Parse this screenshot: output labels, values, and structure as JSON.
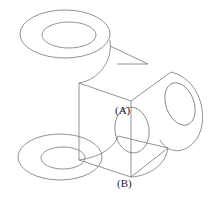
{
  "figure": {
    "line_color": "#777777",
    "background": "#ffffff",
    "labels": {
      "a": "(A)",
      "b": "(B)"
    }
  }
}
